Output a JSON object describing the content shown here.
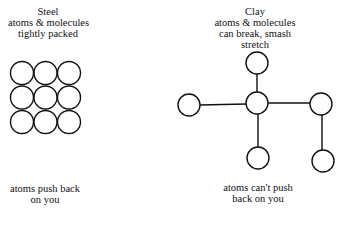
{
  "steel": {
    "title": "Steel",
    "desc_line1": "atoms & molecules",
    "desc_line2": "tightly packed",
    "caption_line1": "atoms push back",
    "caption_line2": "on you",
    "atom_grid": {
      "rows": 3,
      "cols": 3
    }
  },
  "clay": {
    "title": "Clay",
    "desc_line1": "atoms & molecules",
    "desc_line2": "can break, smash",
    "desc_line3": "stretch",
    "caption_line1": "atoms can't push",
    "caption_line2": "back on you",
    "atom_count": 6
  },
  "colors": {
    "stroke": "#111111",
    "background": "#ffffff"
  }
}
